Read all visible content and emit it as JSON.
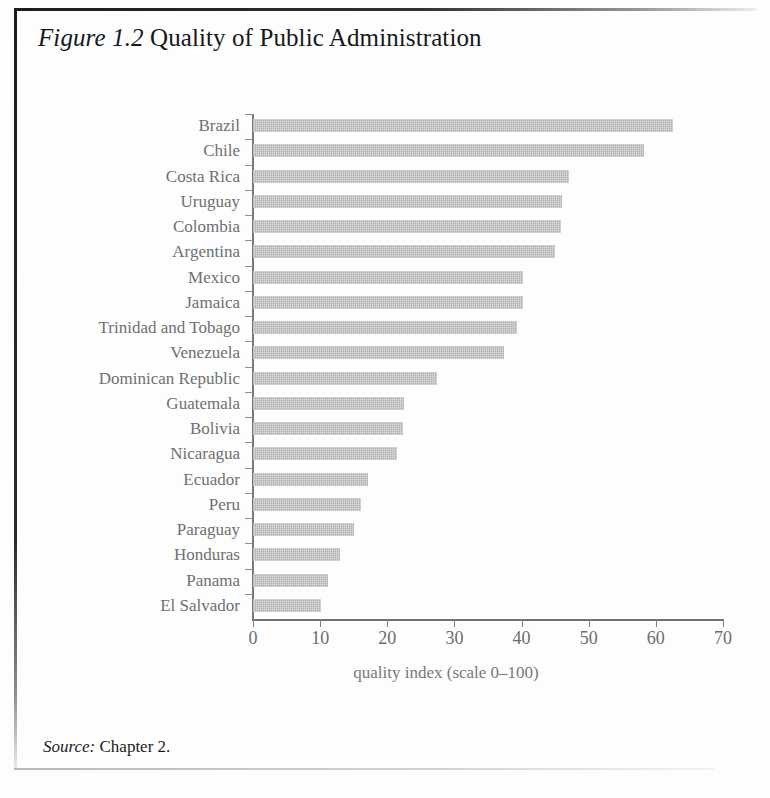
{
  "figure": {
    "label": "Figure 1.2",
    "label_prefix": "Figure",
    "label_number": "1.2",
    "title": "Quality of Public Administration",
    "full_title": "Figure 1.2 Quality of Public Administration"
  },
  "source": {
    "prefix": "Source:",
    "text": "Chapter 2.",
    "full": "Source: Chapter 2."
  },
  "colors": {
    "bar_fill": "#bcbcbc",
    "axis": "#76797c",
    "label_text": "#6d7073",
    "title_text": "#15181c",
    "page_background": "#fdfdfd"
  },
  "chart_data": {
    "type": "bar",
    "orientation": "horizontal",
    "xlabel": "quality index (scale 0–100)",
    "ylabel": "",
    "xlim": [
      0,
      70
    ],
    "xticks": [
      0,
      10,
      20,
      30,
      40,
      50,
      60,
      70
    ],
    "xtick_labels": [
      "0",
      "10",
      "20",
      "30",
      "40",
      "50",
      "60",
      "70"
    ],
    "grid": false,
    "legend": null,
    "categories": [
      "Brazil",
      "Chile",
      "Costa Rica",
      "Uruguay",
      "Colombia",
      "Argentina",
      "Mexico",
      "Jamaica",
      "Trinidad and Tobago",
      "Venezuela",
      "Dominican Republic",
      "Guatemala",
      "Bolivia",
      "Nicaragua",
      "Ecuador",
      "Peru",
      "Paraguay",
      "Honduras",
      "Panama",
      "El Salvador"
    ],
    "values": [
      62.5,
      58.3,
      47.0,
      46.0,
      45.8,
      45.0,
      40.2,
      40.2,
      39.3,
      37.4,
      27.4,
      22.5,
      22.4,
      21.5,
      17.2,
      16.1,
      15.0,
      13.0,
      11.2,
      10.2
    ]
  }
}
